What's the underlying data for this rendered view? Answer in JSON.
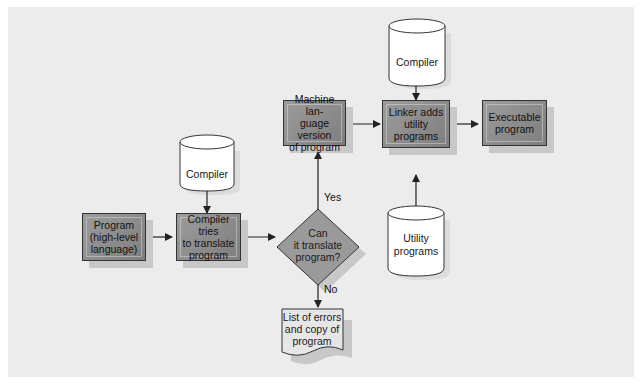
{
  "diagram": {
    "type": "flowchart",
    "nodes": {
      "program": {
        "label": "Program\n(high-level\nlanguage)",
        "shape": "process"
      },
      "compiler_tries": {
        "label": "Compiler tries\nto translate\nprogram",
        "shape": "process"
      },
      "compiler_db_1": {
        "label": "Compiler",
        "shape": "cylinder"
      },
      "decision": {
        "label": "Can\nit translate\nprogram?",
        "shape": "decision"
      },
      "machine_lang": {
        "label": "Machine lan-\nguage version\nof program",
        "shape": "process"
      },
      "errors": {
        "label": "List of errors\nand copy of\nprogram",
        "shape": "document"
      },
      "linker": {
        "label": "Linker adds\nutility\nprograms",
        "shape": "process"
      },
      "compiler_db_2": {
        "label": "Compiler",
        "shape": "cylinder"
      },
      "utility_db": {
        "label": "Utility\nprograms",
        "shape": "cylinder"
      },
      "executable": {
        "label": "Executable\nprogram",
        "shape": "process"
      }
    },
    "edges": [
      {
        "from": "program",
        "to": "compiler_tries",
        "label": ""
      },
      {
        "from": "compiler_db_1",
        "to": "compiler_tries",
        "label": ""
      },
      {
        "from": "compiler_tries",
        "to": "decision",
        "label": ""
      },
      {
        "from": "decision",
        "to": "machine_lang",
        "label": "Yes"
      },
      {
        "from": "decision",
        "to": "errors",
        "label": "No"
      },
      {
        "from": "machine_lang",
        "to": "linker",
        "label": ""
      },
      {
        "from": "compiler_db_2",
        "to": "linker",
        "label": ""
      },
      {
        "from": "utility_db",
        "to": "linker",
        "label": ""
      },
      {
        "from": "linker",
        "to": "executable",
        "label": ""
      }
    ],
    "edge_labels": {
      "yes": "Yes",
      "no": "No"
    },
    "colors": {
      "background": "#ececec",
      "box_fill": "#8e8e8e",
      "shadow": "#c8c8c8",
      "stroke": "#333333",
      "cylinder_fill": "#ffffff"
    }
  }
}
